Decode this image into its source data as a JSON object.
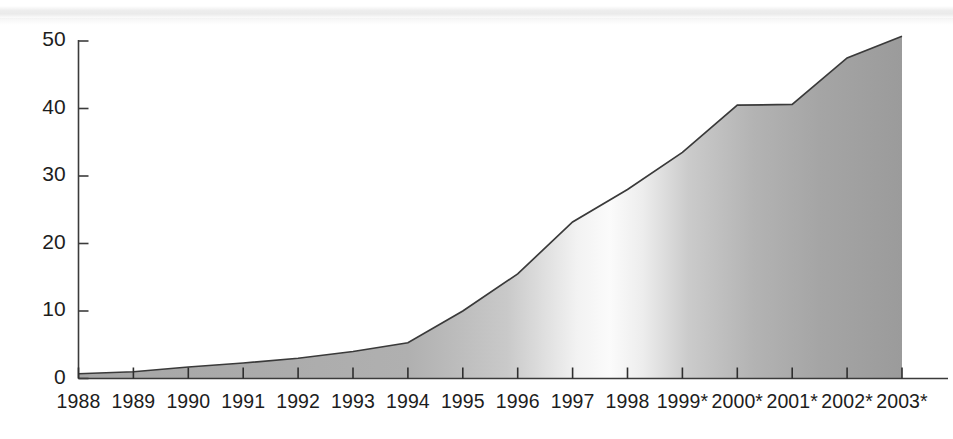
{
  "chart_data": {
    "type": "area",
    "title": "",
    "subtitle": "",
    "xlabel": "",
    "ylabel": "",
    "categories": [
      "1988",
      "1989",
      "1990",
      "1991",
      "1992",
      "1993",
      "1994",
      "1995",
      "1996",
      "1997",
      "1998",
      "1999*",
      "2000*",
      "2001*",
      "2002*",
      "2003*"
    ],
    "values": [
      0.7,
      1.0,
      1.7,
      2.3,
      3.0,
      4.0,
      5.3,
      10.0,
      15.5,
      23.2,
      28.0,
      33.5,
      40.5,
      40.6,
      47.5,
      50.7
    ],
    "series": [
      {
        "name": "",
        "values": [
          0.7,
          1.0,
          1.7,
          2.3,
          3.0,
          4.0,
          5.3,
          10.0,
          15.5,
          23.2,
          28.0,
          33.5,
          40.5,
          40.6,
          47.5,
          50.7
        ]
      }
    ],
    "ylim": [
      0,
      50
    ],
    "yticks": [
      0,
      10,
      20,
      30,
      40,
      50
    ],
    "ytick_labels": [
      "0",
      "10",
      "20",
      "30",
      "40",
      "50"
    ],
    "xlim_categories": [
      "1988",
      "2003*"
    ],
    "grid": false,
    "legend": false,
    "legend_position": "none",
    "annotations": [
      "* denotes projected / forecast years (1999*-2003*)"
    ],
    "fill_style": "horizontal grayscale gradient with light highlight near 1998-1999",
    "line_color": "#3a3a3a",
    "axis_color": "#3b3b3b"
  },
  "axes": {
    "y_tick_labels": [
      "50",
      "40",
      "30",
      "20",
      "10",
      "0"
    ],
    "x_tick_labels": [
      "1988",
      "1989",
      "1990",
      "1991",
      "1992",
      "1993",
      "1994",
      "1995",
      "1996",
      "1997",
      "1998",
      "1999*",
      "2000*",
      "2001*",
      "2002*",
      "2003*"
    ]
  },
  "colors": {
    "background": "#ffffff",
    "axis": "#3b3b3b",
    "series_line": "#3a3a3a",
    "fill_dark": "#9b9b9b",
    "fill_mid": "#b4b4b4",
    "fill_light": "#f4f4f4",
    "text": "#1d1d1d",
    "scan_band": "#d9d9d9"
  }
}
